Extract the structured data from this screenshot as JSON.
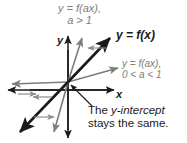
{
  "figure": {
    "background": "#ffffff",
    "colors": {
      "primary_curve": "#1a1a1a",
      "transformed_curve": "#7d7d7d",
      "axis": "#1a1a1a",
      "text_dark": "#1a1a1a",
      "text_gray": "#7d7d7d"
    },
    "axes": {
      "x_label": "x",
      "y_label": "y",
      "origin": {
        "x": 68,
        "y": 82
      }
    },
    "labels": {
      "top_curve": {
        "line1": "y = f(ax),",
        "line2": "a > 1",
        "color": "#7d7d7d"
      },
      "base_curve": {
        "line1": "y = f(x)",
        "color": "#1a1a1a"
      },
      "shallow_curve": {
        "line1": "y = f(ax),",
        "line2": "0 < a < 1",
        "color": "#7d7d7d"
      },
      "callout": {
        "line1_prefix": "The ",
        "line1_italic": "y-intercept",
        "line2": "stays the same.",
        "color": "#1a1a1a"
      }
    },
    "lines": [
      {
        "name": "y = f(x)",
        "style": "thick-black",
        "slope_description": "moderate positive slope through origin",
        "color": "#1a1a1a"
      },
      {
        "name": "y = f(ax), a > 1",
        "style": "thin-gray",
        "slope_description": "steep positive slope through origin",
        "color": "#7d7d7d"
      },
      {
        "name": "y = f(ax), 0 < a < 1",
        "style": "thin-gray",
        "slope_description": "shallow positive slope through origin",
        "color": "#7d7d7d"
      }
    ],
    "indicator_arrows": [
      {
        "name": "compress-arrow-upper-right",
        "direction": "left"
      },
      {
        "name": "compress-arrow-lower-left",
        "direction": "left"
      },
      {
        "name": "stretch-arrow-upper-right",
        "direction": "right"
      },
      {
        "name": "stretch-arrow-lower-left",
        "direction": "right"
      }
    ]
  }
}
